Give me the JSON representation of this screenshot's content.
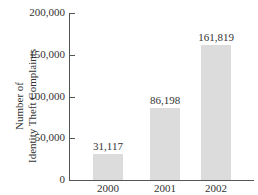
{
  "chart_data": {
    "type": "bar",
    "title": "",
    "xlabel": "",
    "ylabel": "Number of Identity Theft Complaints",
    "categories": [
      "2000",
      "2001",
      "2002"
    ],
    "values": [
      31117,
      86198,
      161819
    ],
    "data_labels": [
      "31,117",
      "86,198",
      "161,819"
    ],
    "ylim": [
      0,
      200000
    ],
    "yticks": [
      0,
      50000,
      100000,
      150000,
      200000
    ],
    "ytick_labels": [
      "0",
      "50,000",
      "100,000",
      "150,000",
      "200,000"
    ],
    "grid": false,
    "legend": null,
    "bar_color": "#dcdcdc"
  },
  "labels": {
    "ylabel_line1": "Number of",
    "ylabel_line2": "Identity Theft Complaints"
  }
}
